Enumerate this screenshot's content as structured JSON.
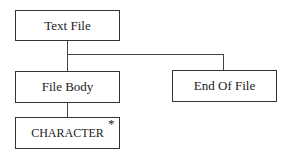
{
  "diagram": {
    "nodes": [
      {
        "id": "text-file",
        "label": "Text File"
      },
      {
        "id": "file-body",
        "label": "File Body"
      },
      {
        "id": "end-of-file",
        "label": "End Of File"
      },
      {
        "id": "character",
        "label": "CHARACTER",
        "marker": "*"
      }
    ],
    "edges": [
      {
        "from": "text-file",
        "to": "file-body"
      },
      {
        "from": "text-file",
        "to": "end-of-file"
      },
      {
        "from": "file-body",
        "to": "character"
      }
    ]
  }
}
